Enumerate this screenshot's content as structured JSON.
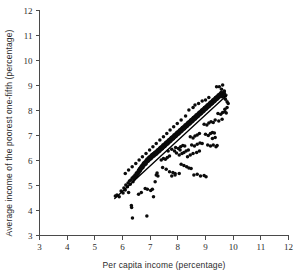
{
  "chart_data": {
    "type": "scatter",
    "title": "",
    "xlabel": "Per capita income (percentage)",
    "ylabel": "Average income of the poorest one-fifth (percentage)",
    "xlim": [
      3,
      12
    ],
    "ylim": [
      3,
      12
    ],
    "xticks": [
      3,
      4,
      5,
      6,
      7,
      8,
      9,
      10,
      11,
      12
    ],
    "yticks": [
      3,
      4,
      5,
      6,
      7,
      8,
      9,
      10,
      11,
      12
    ],
    "xtick_labels": [
      "3",
      "4",
      "5",
      "6",
      "7",
      "8",
      "9",
      "10",
      "11",
      "12"
    ],
    "ytick_labels": [
      "3",
      "4",
      "5",
      "6",
      "7",
      "8",
      "9",
      "10",
      "11",
      "12"
    ],
    "grid": false,
    "legend": null,
    "marker": {
      "shape": "circle",
      "color": "#0b0b0b",
      "size": 1.75
    },
    "fit_line": {
      "visible": true,
      "color": "#000000",
      "x_start": 5.72,
      "y_start": 4.48,
      "x_end": 9.78,
      "y_end": 8.62,
      "slope": 1.02,
      "intercept": -1.36
    },
    "points": [
      [
        5.74,
        4.58
      ],
      [
        5.8,
        4.62
      ],
      [
        5.88,
        4.55
      ],
      [
        5.95,
        4.78
      ],
      [
        6.02,
        4.7
      ],
      [
        6.05,
        4.9
      ],
      [
        6.1,
        4.82
      ],
      [
        6.12,
        5.02
      ],
      [
        6.18,
        4.95
      ],
      [
        6.2,
        5.1
      ],
      [
        6.22,
        4.72
      ],
      [
        6.25,
        5.18
      ],
      [
        6.28,
        5.05
      ],
      [
        6.3,
        5.22
      ],
      [
        6.32,
        4.2
      ],
      [
        6.33,
        4.12
      ],
      [
        6.35,
        5.3
      ],
      [
        6.36,
        3.7
      ],
      [
        6.38,
        5.15
      ],
      [
        6.4,
        5.35
      ],
      [
        6.42,
        5.25
      ],
      [
        6.45,
        5.42
      ],
      [
        6.48,
        5.32
      ],
      [
        6.5,
        5.5
      ],
      [
        6.52,
        5.38
      ],
      [
        6.55,
        5.55
      ],
      [
        6.56,
        5.45
      ],
      [
        6.58,
        5.62
      ],
      [
        6.6,
        5.52
      ],
      [
        6.62,
        5.68
      ],
      [
        6.64,
        5.58
      ],
      [
        6.65,
        5.72
      ],
      [
        6.66,
        5.62
      ],
      [
        6.68,
        5.78
      ],
      [
        6.7,
        5.68
      ],
      [
        6.72,
        5.82
      ],
      [
        6.74,
        5.72
      ],
      [
        6.75,
        5.88
      ],
      [
        6.76,
        5.78
      ],
      [
        6.78,
        5.92
      ],
      [
        6.8,
        5.82
      ],
      [
        6.82,
        5.95
      ],
      [
        6.84,
        5.85
      ],
      [
        6.85,
        6.0
      ],
      [
        6.86,
        5.9
      ],
      [
        6.88,
        6.05
      ],
      [
        6.9,
        5.95
      ],
      [
        6.92,
        6.08
      ],
      [
        6.94,
        5.98
      ],
      [
        6.95,
        6.12
      ],
      [
        6.96,
        6.02
      ],
      [
        6.98,
        6.15
      ],
      [
        7.0,
        6.05
      ],
      [
        7.02,
        6.18
      ],
      [
        7.04,
        6.08
      ],
      [
        7.05,
        6.22
      ],
      [
        7.06,
        6.12
      ],
      [
        7.08,
        6.25
      ],
      [
        7.1,
        6.15
      ],
      [
        7.12,
        6.28
      ],
      [
        6.82,
        4.88
      ],
      [
        6.9,
        4.85
      ],
      [
        7.02,
        4.8
      ],
      [
        7.08,
        4.85
      ],
      [
        6.88,
        3.78
      ],
      [
        7.12,
        4.55
      ],
      [
        7.18,
        5.15
      ],
      [
        7.22,
        5.42
      ],
      [
        7.25,
        5.5
      ],
      [
        7.28,
        5.38
      ],
      [
        7.14,
        6.18
      ],
      [
        7.16,
        6.32
      ],
      [
        7.18,
        6.22
      ],
      [
        7.2,
        6.35
      ],
      [
        7.22,
        6.25
      ],
      [
        7.24,
        6.38
      ],
      [
        7.25,
        6.28
      ],
      [
        7.26,
        6.42
      ],
      [
        7.28,
        6.32
      ],
      [
        7.3,
        6.45
      ],
      [
        7.32,
        6.35
      ],
      [
        7.34,
        6.48
      ],
      [
        7.35,
        6.38
      ],
      [
        7.36,
        6.52
      ],
      [
        7.38,
        6.42
      ],
      [
        7.4,
        6.55
      ],
      [
        7.42,
        6.45
      ],
      [
        7.44,
        6.58
      ],
      [
        7.45,
        6.48
      ],
      [
        7.46,
        6.62
      ],
      [
        7.48,
        6.52
      ],
      [
        7.5,
        6.65
      ],
      [
        7.52,
        6.55
      ],
      [
        7.54,
        6.68
      ],
      [
        7.55,
        6.58
      ],
      [
        7.56,
        6.72
      ],
      [
        7.58,
        6.62
      ],
      [
        7.6,
        6.75
      ],
      [
        7.62,
        6.65
      ],
      [
        7.64,
        6.78
      ],
      [
        7.65,
        6.68
      ],
      [
        7.66,
        6.82
      ],
      [
        7.68,
        6.72
      ],
      [
        7.7,
        6.85
      ],
      [
        7.72,
        6.75
      ],
      [
        7.74,
        6.88
      ],
      [
        7.75,
        6.78
      ],
      [
        7.76,
        6.92
      ],
      [
        7.78,
        6.82
      ],
      [
        7.8,
        6.95
      ],
      [
        7.4,
        6.02
      ],
      [
        7.48,
        6.08
      ],
      [
        7.55,
        6.05
      ],
      [
        7.62,
        6.12
      ],
      [
        7.7,
        6.18
      ],
      [
        7.45,
        5.72
      ],
      [
        7.58,
        5.65
      ],
      [
        7.7,
        5.55
      ],
      [
        7.82,
        5.52
      ],
      [
        7.9,
        5.48
      ],
      [
        7.82,
        6.85
      ],
      [
        7.84,
        6.98
      ],
      [
        7.85,
        6.88
      ],
      [
        7.86,
        7.02
      ],
      [
        7.88,
        6.92
      ],
      [
        7.9,
        7.05
      ],
      [
        7.92,
        6.95
      ],
      [
        7.94,
        7.08
      ],
      [
        7.95,
        6.98
      ],
      [
        7.96,
        7.12
      ],
      [
        7.98,
        7.02
      ],
      [
        8.0,
        7.15
      ],
      [
        8.02,
        7.05
      ],
      [
        8.04,
        7.18
      ],
      [
        8.05,
        7.08
      ],
      [
        8.06,
        7.22
      ],
      [
        8.08,
        7.12
      ],
      [
        8.1,
        7.25
      ],
      [
        8.12,
        7.15
      ],
      [
        8.14,
        7.28
      ],
      [
        8.15,
        7.18
      ],
      [
        8.16,
        7.32
      ],
      [
        8.18,
        7.22
      ],
      [
        8.2,
        7.35
      ],
      [
        8.22,
        7.25
      ],
      [
        8.24,
        7.38
      ],
      [
        8.25,
        7.28
      ],
      [
        8.26,
        7.42
      ],
      [
        8.28,
        7.32
      ],
      [
        8.3,
        7.45
      ],
      [
        7.92,
        6.52
      ],
      [
        8.02,
        6.48
      ],
      [
        8.1,
        6.55
      ],
      [
        8.18,
        6.6
      ],
      [
        8.25,
        6.58
      ],
      [
        8.05,
        6.22
      ],
      [
        8.15,
        6.28
      ],
      [
        8.22,
        6.32
      ],
      [
        8.3,
        6.38
      ],
      [
        8.38,
        6.42
      ],
      [
        8.12,
        5.85
      ],
      [
        8.22,
        5.8
      ],
      [
        8.32,
        5.75
      ],
      [
        8.4,
        5.7
      ],
      [
        8.48,
        5.68
      ],
      [
        8.32,
        7.35
      ],
      [
        8.34,
        7.48
      ],
      [
        8.35,
        7.38
      ],
      [
        8.36,
        7.52
      ],
      [
        8.38,
        7.42
      ],
      [
        8.4,
        7.55
      ],
      [
        8.42,
        7.45
      ],
      [
        8.44,
        7.58
      ],
      [
        8.45,
        7.48
      ],
      [
        8.46,
        7.62
      ],
      [
        8.48,
        7.52
      ],
      [
        8.5,
        7.65
      ],
      [
        8.52,
        7.55
      ],
      [
        8.54,
        7.68
      ],
      [
        8.55,
        7.58
      ],
      [
        8.56,
        7.72
      ],
      [
        8.58,
        7.62
      ],
      [
        8.6,
        7.75
      ],
      [
        8.62,
        7.65
      ],
      [
        8.64,
        7.78
      ],
      [
        8.65,
        7.68
      ],
      [
        8.66,
        7.82
      ],
      [
        8.68,
        7.72
      ],
      [
        8.7,
        7.85
      ],
      [
        8.72,
        7.75
      ],
      [
        8.74,
        7.88
      ],
      [
        8.75,
        7.78
      ],
      [
        8.76,
        7.92
      ],
      [
        8.78,
        7.82
      ],
      [
        8.8,
        7.95
      ],
      [
        8.45,
        6.95
      ],
      [
        8.55,
        6.9
      ],
      [
        8.62,
        6.98
      ],
      [
        8.7,
        7.02
      ],
      [
        8.78,
        7.08
      ],
      [
        8.5,
        6.62
      ],
      [
        8.6,
        6.58
      ],
      [
        8.7,
        6.65
      ],
      [
        8.8,
        6.7
      ],
      [
        8.88,
        6.68
      ],
      [
        8.58,
        5.42
      ],
      [
        8.7,
        5.45
      ],
      [
        8.82,
        5.38
      ],
      [
        8.95,
        5.4
      ],
      [
        9.02,
        5.35
      ],
      [
        8.82,
        7.85
      ],
      [
        8.84,
        7.98
      ],
      [
        8.85,
        7.88
      ],
      [
        8.86,
        8.02
      ],
      [
        8.88,
        7.92
      ],
      [
        8.9,
        8.05
      ],
      [
        8.92,
        7.95
      ],
      [
        8.94,
        8.08
      ],
      [
        8.95,
        7.98
      ],
      [
        8.96,
        8.12
      ],
      [
        8.98,
        8.02
      ],
      [
        9.0,
        8.15
      ],
      [
        9.02,
        8.05
      ],
      [
        9.04,
        8.18
      ],
      [
        9.05,
        8.08
      ],
      [
        9.06,
        8.22
      ],
      [
        9.08,
        8.12
      ],
      [
        9.1,
        8.25
      ],
      [
        9.12,
        8.15
      ],
      [
        9.14,
        8.28
      ],
      [
        9.15,
        8.18
      ],
      [
        9.16,
        8.32
      ],
      [
        9.18,
        8.22
      ],
      [
        9.2,
        8.35
      ],
      [
        9.22,
        8.25
      ],
      [
        9.24,
        8.38
      ],
      [
        9.25,
        8.28
      ],
      [
        9.26,
        8.42
      ],
      [
        9.28,
        8.32
      ],
      [
        9.3,
        8.45
      ],
      [
        8.95,
        7.45
      ],
      [
        9.05,
        7.42
      ],
      [
        9.12,
        7.5
      ],
      [
        9.2,
        7.55
      ],
      [
        9.28,
        7.52
      ],
      [
        9.0,
        7.05
      ],
      [
        9.1,
        7.0
      ],
      [
        9.18,
        7.08
      ],
      [
        9.25,
        7.12
      ],
      [
        9.32,
        7.1
      ],
      [
        9.08,
        6.62
      ],
      [
        9.18,
        6.58
      ],
      [
        9.28,
        6.62
      ],
      [
        9.38,
        6.55
      ],
      [
        9.42,
        6.6
      ],
      [
        9.32,
        8.35
      ],
      [
        9.34,
        8.48
      ],
      [
        9.35,
        8.38
      ],
      [
        9.36,
        8.52
      ],
      [
        9.38,
        8.42
      ],
      [
        9.4,
        8.55
      ],
      [
        9.42,
        8.45
      ],
      [
        9.44,
        8.58
      ],
      [
        9.45,
        8.48
      ],
      [
        9.46,
        8.62
      ],
      [
        9.48,
        8.52
      ],
      [
        9.5,
        8.65
      ],
      [
        9.52,
        8.55
      ],
      [
        9.54,
        8.68
      ],
      [
        9.55,
        8.58
      ],
      [
        9.56,
        8.72
      ],
      [
        9.58,
        8.62
      ],
      [
        9.6,
        8.55
      ],
      [
        9.62,
        8.68
      ],
      [
        9.64,
        8.58
      ],
      [
        9.65,
        8.72
      ],
      [
        9.66,
        8.62
      ],
      [
        9.68,
        8.75
      ],
      [
        9.7,
        8.65
      ],
      [
        9.72,
        8.58
      ],
      [
        9.45,
        7.88
      ],
      [
        9.55,
        7.85
      ],
      [
        9.62,
        7.92
      ],
      [
        9.7,
        7.95
      ],
      [
        9.75,
        7.9
      ],
      [
        9.5,
        8.95
      ],
      [
        9.58,
        8.85
      ],
      [
        9.68,
        8.78
      ],
      [
        9.72,
        8.45
      ],
      [
        9.78,
        8.35
      ],
      [
        9.4,
        8.95
      ],
      [
        9.62,
        9.02
      ],
      [
        9.7,
        8.05
      ],
      [
        9.78,
        8.12
      ],
      [
        9.82,
        8.28
      ],
      [
        9.35,
        7.62
      ],
      [
        9.48,
        7.58
      ],
      [
        9.6,
        7.65
      ],
      [
        9.25,
        6.88
      ],
      [
        9.35,
        6.92
      ],
      [
        8.4,
        8.02
      ],
      [
        8.55,
        8.12
      ],
      [
        8.28,
        7.78
      ],
      [
        8.12,
        7.62
      ],
      [
        7.98,
        7.48
      ],
      [
        7.85,
        7.35
      ],
      [
        7.72,
        7.22
      ],
      [
        7.6,
        7.08
      ],
      [
        7.48,
        6.95
      ],
      [
        7.35,
        6.82
      ],
      [
        7.22,
        6.68
      ],
      [
        7.1,
        6.55
      ],
      [
        6.98,
        6.42
      ],
      [
        6.85,
        6.28
      ],
      [
        6.72,
        6.15
      ],
      [
        6.6,
        6.02
      ],
      [
        6.48,
        5.88
      ],
      [
        6.35,
        5.75
      ],
      [
        6.22,
        5.62
      ],
      [
        6.1,
        5.48
      ],
      [
        7.78,
        5.38
      ],
      [
        7.9,
        5.42
      ],
      [
        8.05,
        5.48
      ],
      [
        6.58,
        4.65
      ],
      [
        6.68,
        4.72
      ],
      [
        8.62,
        8.22
      ],
      [
        8.75,
        8.28
      ],
      [
        8.88,
        8.38
      ],
      [
        9.0,
        8.42
      ],
      [
        9.12,
        8.52
      ],
      [
        8.35,
        6.15
      ],
      [
        8.45,
        6.22
      ],
      [
        8.55,
        6.28
      ],
      [
        8.68,
        6.32
      ],
      [
        8.78,
        6.38
      ],
      [
        7.65,
        6.38
      ],
      [
        7.78,
        6.45
      ],
      [
        7.88,
        6.38
      ],
      [
        7.95,
        6.3
      ],
      [
        8.08,
        6.42
      ]
    ]
  }
}
